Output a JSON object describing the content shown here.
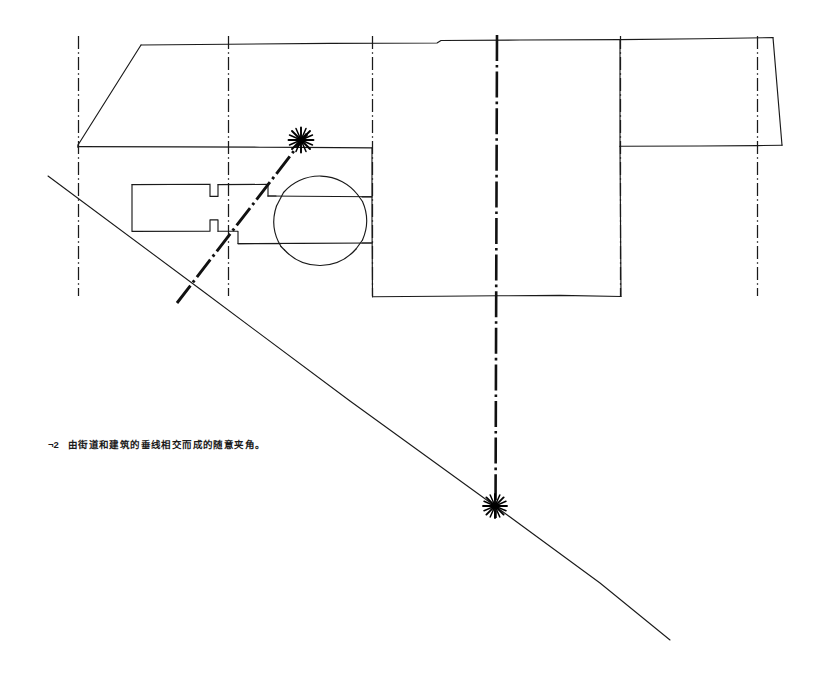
{
  "figure": {
    "name": "site-plan-sketch",
    "caption_marker": "¬2",
    "caption_text": "由街道和建筑的垂线相交而成的随意夹角。",
    "ink_color": "#1a1a1a",
    "background_color": "#ffffff"
  },
  "legend": {
    "solid_line": "building-outline",
    "thin_dash_dot": "street-centerline",
    "thick_dash_dot": "diagonal-street-axis",
    "star_marker": "intersection-node"
  },
  "elements": {
    "grid_axes": [
      {
        "name": "axis-left",
        "x": 78
      },
      {
        "name": "axis-second",
        "x": 228
      },
      {
        "name": "axis-third",
        "x": 372
      },
      {
        "name": "axis-center-main",
        "x": 497
      },
      {
        "name": "axis-fifth",
        "x": 620
      },
      {
        "name": "axis-right",
        "x": 757
      }
    ],
    "nodes": [
      {
        "name": "intersection-node-upper",
        "x": 301,
        "y": 140
      },
      {
        "name": "intersection-node-lower",
        "x": 495,
        "y": 506
      }
    ],
    "roundabout": {
      "name": "circular-plaza",
      "cx": 322,
      "cy": 220,
      "r": 48
    },
    "diagonal_street": {
      "name": "diagonal-street-line",
      "x1": 48,
      "y1": 176,
      "x2": 670,
      "y2": 640
    },
    "diagonal_axis": {
      "name": "diagonal-dash-dot-axis",
      "x1": 177,
      "y1": 303,
      "x2": 308,
      "y2": 133
    }
  }
}
